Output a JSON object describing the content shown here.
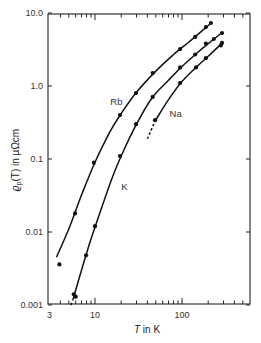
{
  "chart_data": {
    "type": "scatter",
    "title": "",
    "xlabel": "T in K",
    "ylabel": "ϱp(T) in μΩcm",
    "xscale": "log",
    "yscale": "log",
    "xlim": [
      3,
      560
    ],
    "ylim": [
      0.001,
      10.0
    ],
    "grid": false,
    "legend": "inline labels",
    "x_tick_labels": [
      "3",
      "10",
      "100"
    ],
    "y_tick_labels": [
      "0.001",
      "0.01",
      "0.1",
      "1.0",
      "10.0"
    ],
    "series": [
      {
        "name": "Rb",
        "points": [
          [
            3.9,
            0.0036
          ],
          [
            5.9,
            0.018
          ],
          [
            9.7,
            0.089
          ],
          [
            19.4,
            0.4
          ],
          [
            29.6,
            0.8
          ],
          [
            46,
            1.5
          ],
          [
            95,
            3.2
          ],
          [
            142,
            4.7
          ],
          [
            188,
            6.4
          ],
          [
            215,
            7.3
          ]
        ],
        "curve": [
          [
            3.6,
            0.0045
          ],
          [
            5,
            0.011
          ],
          [
            7,
            0.032
          ],
          [
            10,
            0.09
          ],
          [
            15,
            0.24
          ],
          [
            20,
            0.42
          ],
          [
            30,
            0.82
          ],
          [
            50,
            1.6
          ],
          [
            80,
            2.7
          ],
          [
            120,
            4.0
          ],
          [
            170,
            5.7
          ],
          [
            220,
            7.4
          ]
        ]
      },
      {
        "name": "K",
        "points": [
          [
            5.7,
            0.0014
          ],
          [
            6.0,
            0.0013
          ],
          [
            7.9,
            0.0048
          ],
          [
            10,
            0.012
          ],
          [
            19.4,
            0.11
          ],
          [
            29.6,
            0.3
          ],
          [
            46,
            0.71
          ],
          [
            95,
            1.8
          ],
          [
            142,
            2.7
          ],
          [
            188,
            3.8
          ],
          [
            232,
            4.4
          ],
          [
            288,
            5.3
          ]
        ],
        "curve": [
          [
            5.6,
            0.0012
          ],
          [
            7,
            0.003
          ],
          [
            9,
            0.008
          ],
          [
            12,
            0.022
          ],
          [
            16,
            0.058
          ],
          [
            20,
            0.11
          ],
          [
            30,
            0.3
          ],
          [
            45,
            0.68
          ],
          [
            70,
            1.2
          ],
          [
            100,
            1.85
          ],
          [
            150,
            2.85
          ],
          [
            200,
            3.8
          ],
          [
            290,
            5.4
          ]
        ],
        "dashed_start": [
          [
            5.3,
            0.001
          ],
          [
            5.6,
            0.0012
          ]
        ]
      },
      {
        "name": "Na",
        "points": [
          [
            49,
            0.34
          ],
          [
            95,
            1.1
          ],
          [
            145,
            1.8
          ],
          [
            188,
            2.4
          ],
          [
            280,
            3.6
          ],
          [
            288,
            3.9
          ]
        ],
        "curve": [
          [
            49,
            0.33
          ],
          [
            70,
            0.65
          ],
          [
            100,
            1.15
          ],
          [
            145,
            1.8
          ],
          [
            200,
            2.55
          ],
          [
            290,
            3.9
          ]
        ],
        "dashed_start": [
          [
            40,
            0.19
          ],
          [
            49,
            0.33
          ]
        ]
      }
    ],
    "annotations": [
      {
        "text": "Rb",
        "T": 15,
        "rho": 0.55
      },
      {
        "text": "K",
        "T": 20,
        "rho": 0.038
      },
      {
        "text": "Na",
        "T": 72,
        "rho": 0.38
      }
    ]
  },
  "axes": {
    "xlabel_var": "T",
    "xlabel_rest": " in K",
    "ylabel_main": "ϱ",
    "ylabel_sub": "p",
    "ylabel_rest": "(T) in μΩcm"
  }
}
